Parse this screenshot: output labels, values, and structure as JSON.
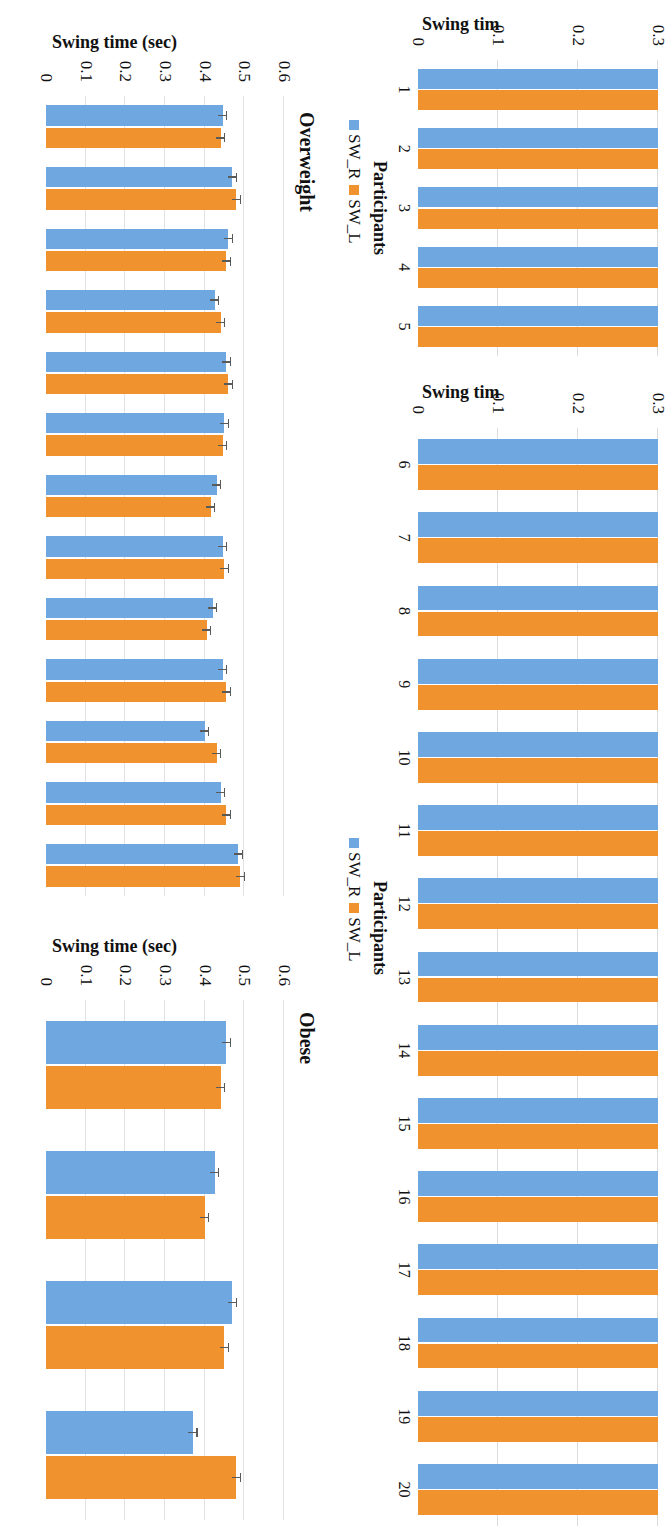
{
  "figure": {
    "orientation": "rotated-90-clockwise",
    "colors": {
      "sw_r": "#6fa8e0",
      "sw_l": "#f0932f",
      "grid": "#d9d9d9",
      "error": "#5a5a5a"
    }
  },
  "legend": {
    "title": "Participants",
    "entries": [
      {
        "label": "SW_R",
        "color": "#6fa8e0"
      },
      {
        "label": "SW_L",
        "color": "#f0932f"
      }
    ]
  },
  "axis_titles": {
    "participants_y_truncated": "Swing tim",
    "swing_time": "Swing time (sec)",
    "participants_x": "Participants"
  },
  "panel_titles": {
    "obese": "Obese",
    "overweight": "Overweight"
  },
  "chart_data": [
    {
      "id": "participants-1-5",
      "type": "bar",
      "title": "",
      "xlabel": "Participants",
      "ylabel": "Swing tim",
      "ylim": [
        0,
        0.3
      ],
      "yticks": [
        "0",
        "0.1",
        "0.2",
        "0.3"
      ],
      "grid": true,
      "legend_position": "bottom",
      "categories": [
        "1",
        "2",
        "3",
        "4",
        "5"
      ],
      "series": [
        {
          "name": "SW_R",
          "color": "#6fa8e0",
          "values": [
            0.36,
            0.36,
            0.35,
            0.36,
            0.36
          ]
        },
        {
          "name": "SW_L",
          "color": "#f0932f",
          "values": [
            0.35,
            0.35,
            0.35,
            0.35,
            0.35
          ]
        }
      ],
      "note": "Bars extend beyond the visible 0.3 axis limit (plot is cropped)."
    },
    {
      "id": "participants-6-20",
      "type": "bar",
      "title": "",
      "xlabel": "Participants",
      "ylabel": "Swing tim",
      "ylim": [
        0,
        0.3
      ],
      "yticks": [
        "0",
        "0.1",
        "0.2",
        "0.3"
      ],
      "grid": true,
      "legend_position": "bottom",
      "categories": [
        "6",
        "7",
        "8",
        "9",
        "10",
        "11",
        "12",
        "13",
        "14",
        "15",
        "16",
        "17",
        "18",
        "19",
        "20"
      ],
      "series": [
        {
          "name": "SW_R",
          "color": "#6fa8e0",
          "values": [
            0.34,
            0.34,
            0.345,
            0.335,
            0.34,
            0.33,
            0.345,
            0.34,
            0.345,
            0.35,
            0.345,
            0.355,
            0.345,
            0.345,
            0.34
          ]
        },
        {
          "name": "SW_L",
          "color": "#f0932f",
          "values": [
            0.335,
            0.335,
            0.345,
            0.33,
            0.34,
            0.33,
            0.34,
            0.34,
            0.345,
            0.345,
            0.34,
            0.35,
            0.345,
            0.345,
            0.335
          ]
        }
      ],
      "note": "Bars extend beyond the visible 0.3 axis limit (plot is cropped)."
    },
    {
      "id": "overweight",
      "type": "bar",
      "title": "Overweight",
      "xlabel": "",
      "ylabel": "Swing time (sec)",
      "ylim": [
        0,
        0.6
      ],
      "yticks": [
        "0",
        "0.1",
        "0.2",
        "0.3",
        "0.4",
        "0.5",
        "0.6"
      ],
      "grid": true,
      "error_bars": true,
      "categories": [
        "1",
        "2",
        "3",
        "4",
        "5",
        "6",
        "7",
        "8",
        "9",
        "10",
        "11",
        "12",
        "13"
      ],
      "series": [
        {
          "name": "SW_R",
          "color": "#6fa8e0",
          "values": [
            0.445,
            0.47,
            0.46,
            0.425,
            0.455,
            0.45,
            0.43,
            0.445,
            0.42,
            0.445,
            0.4,
            0.44,
            0.485
          ],
          "errors": [
            0.012,
            0.012,
            0.012,
            0.012,
            0.012,
            0.012,
            0.012,
            0.012,
            0.012,
            0.012,
            0.012,
            0.012,
            0.012
          ]
        },
        {
          "name": "SW_L",
          "color": "#f0932f",
          "values": [
            0.44,
            0.48,
            0.455,
            0.44,
            0.46,
            0.445,
            0.415,
            0.45,
            0.405,
            0.455,
            0.43,
            0.455,
            0.49
          ],
          "errors": [
            0.012,
            0.012,
            0.012,
            0.012,
            0.012,
            0.012,
            0.012,
            0.012,
            0.012,
            0.012,
            0.012,
            0.012,
            0.012
          ]
        }
      ]
    },
    {
      "id": "obese",
      "type": "bar",
      "title": "Obese",
      "xlabel": "",
      "ylabel": "Swing time (sec)",
      "ylim": [
        0,
        0.6
      ],
      "yticks": [
        "0",
        "0.1",
        "0.2",
        "0.3",
        "0.4",
        "0.5",
        "0.6"
      ],
      "grid": true,
      "error_bars": true,
      "categories": [
        "1",
        "2",
        "3",
        "4"
      ],
      "series": [
        {
          "name": "SW_R",
          "color": "#6fa8e0",
          "values": [
            0.455,
            0.425,
            0.47,
            0.37
          ],
          "errors": [
            0.012,
            0.012,
            0.012,
            0.012
          ]
        },
        {
          "name": "SW_L",
          "color": "#f0932f",
          "values": [
            0.44,
            0.4,
            0.45,
            0.48
          ],
          "errors": [
            0.012,
            0.012,
            0.012,
            0.012
          ]
        }
      ]
    }
  ]
}
